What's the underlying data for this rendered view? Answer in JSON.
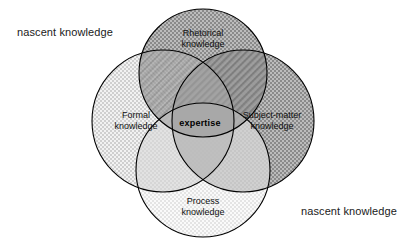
{
  "figure": {
    "type": "venn-diagram",
    "circle_count": 4,
    "background_color": "#ffffff",
    "outline_color": "#000000",
    "center_label": "expertise"
  },
  "circles": [
    {
      "id": "rhetorical",
      "label_line1": "Rhetorical",
      "label_line2": "knowledge",
      "position": "top",
      "fill_pattern": "dark-checker",
      "fill_color": "#8e8e8e"
    },
    {
      "id": "formal",
      "label_line1": "Formal",
      "label_line2": "knowledge",
      "position": "left",
      "fill_pattern": "light-checker",
      "fill_color": "#d8d8d8"
    },
    {
      "id": "subject-matter",
      "label_line1": "Subject-matter",
      "label_line2": "knowledge",
      "position": "right",
      "fill_pattern": "dark-checker",
      "fill_color": "#8e8e8e"
    },
    {
      "id": "process",
      "label_line1": "Process",
      "label_line2": "knowledge",
      "position": "bottom",
      "fill_pattern": "pale-checker",
      "fill_color": "#ededed"
    }
  ],
  "annotations": [
    {
      "id": "top-left",
      "text": "nascent knowledge"
    },
    {
      "id": "bottom-right",
      "text": "nascent knowledge"
    }
  ]
}
